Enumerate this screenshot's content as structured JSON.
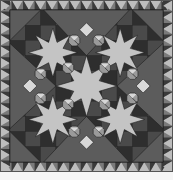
{
  "image": {
    "subject": "grayscale quilt pattern",
    "description": "Square patchwork quilt with a sawtooth triangle border surrounding a central design of interlocking stars, octagonal hourglass blocks, and large dark setting triangles on each side."
  },
  "palette": {
    "background": "#ffffff",
    "border_dark": "#3a3a3a",
    "border_mid": "#7a7a7a",
    "border_light": "#bdbdbd",
    "field_mid": "#6e6e6e",
    "setting_triangle": "#5c5c5c",
    "grid_dark": "#2e2e2e",
    "grid_mid": "#4a4a4a",
    "star_light": "#c4c4c4",
    "star_pale": "#d8d8d8",
    "octagon": "#9a9a9a",
    "line": "#1e1e1e"
  },
  "layout": {
    "width": 173,
    "quilt_height": 172,
    "border_width": 10,
    "border_units_per_side": 15
  }
}
